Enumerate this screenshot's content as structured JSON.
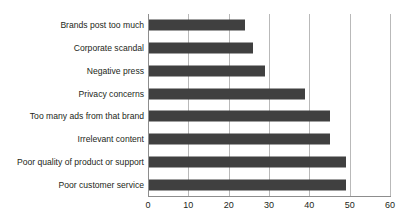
{
  "chart_data": {
    "type": "bar",
    "orientation": "horizontal",
    "title": "",
    "xlabel": "",
    "ylabel": "",
    "categories": [
      "Brands post too much",
      "Corporate scandal",
      "Negative press",
      "Privacy concerns",
      "Too many ads from that brand",
      "Irrelevant content",
      "Poor quality of product or support",
      "Poor customer service"
    ],
    "values": [
      24,
      26,
      29,
      39,
      45,
      45,
      49,
      49
    ],
    "xlim": [
      0,
      60
    ],
    "xticks": [
      0,
      10,
      20,
      30,
      40,
      50,
      60
    ],
    "xtick_labels": [
      "0",
      "10",
      "20",
      "30",
      "40",
      "50",
      "60"
    ],
    "grid": "vertical",
    "legend": "none",
    "bar_color": "#404040",
    "gridline_color": "#b9b9b9",
    "axis_color": "#8d8d8d",
    "background_color": "#ffffff",
    "text_color": "#231f20"
  }
}
